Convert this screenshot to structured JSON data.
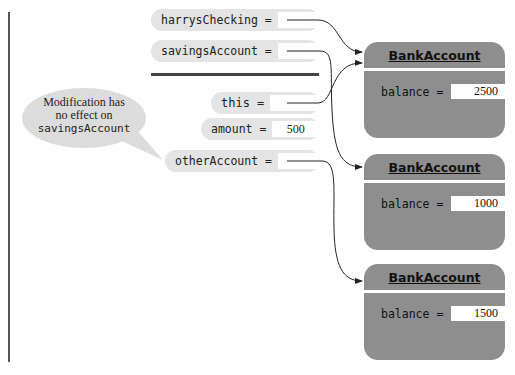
{
  "variables": [
    {
      "name": "harrysChecking",
      "label": "harrysChecking =",
      "value": ""
    },
    {
      "name": "savingsAccount",
      "label": "savingsAccount =",
      "value": ""
    },
    {
      "name": "this",
      "label": "this =",
      "value": ""
    },
    {
      "name": "amount",
      "label": "amount =",
      "value": "500"
    },
    {
      "name": "otherAccount",
      "label": "otherAccount =",
      "value": ""
    }
  ],
  "callout": {
    "line1": "Modification has",
    "line2": "no effect on",
    "line3": "savingsAccount"
  },
  "objects": [
    {
      "class_name": "BankAccount",
      "field_label": "balance =",
      "field_value": "2500"
    },
    {
      "class_name": "BankAccount",
      "field_label": "balance =",
      "field_value": "1000"
    },
    {
      "class_name": "BankAccount",
      "field_label": "balance =",
      "field_value": "1500"
    }
  ],
  "references": [
    {
      "from": "harrysChecking",
      "to_object": 0
    },
    {
      "from": "savingsAccount",
      "to_object": 1
    },
    {
      "from": "this",
      "to_object": 0
    },
    {
      "from": "otherAccount",
      "to_object": 2
    }
  ],
  "colors": {
    "variable_bg": "#e4e4e4",
    "object_bg": "#8e8e8e",
    "callout_bg": "#dcdcdc",
    "line": "#222222"
  }
}
